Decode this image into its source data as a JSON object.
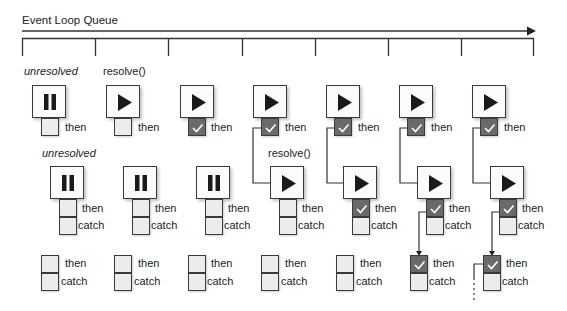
{
  "title": "Event Loop Queue",
  "timeline": {
    "ticks_x": [
      22,
      95,
      168,
      242,
      315,
      388,
      462,
      534
    ],
    "line_color": "#333333"
  },
  "labels": {
    "unresolved_1": "unresolved",
    "resolve_1": "resolve()",
    "unresolved_2": "unresolved",
    "resolve_2": "resolve()"
  },
  "slot_labels": {
    "then": "then",
    "catch": "catch"
  },
  "colors": {
    "checked_fill": "#6a6a6a",
    "unchecked_fill": "#ececec",
    "border": "#3a3a3a"
  },
  "legend": {
    "pause_icon": "unresolved promise",
    "play_icon": "resolved promise",
    "check_icon": "handler triggered"
  },
  "rows": [
    {
      "name": "promise-1",
      "columns": [
        {
          "state": "pause",
          "then": "unchecked"
        },
        {
          "state": "play",
          "then": "unchecked"
        },
        {
          "state": "play",
          "then": "checked"
        },
        {
          "state": "play",
          "then": "checked"
        },
        {
          "state": "play",
          "then": "checked"
        },
        {
          "state": "play",
          "then": "checked"
        },
        {
          "state": "play",
          "then": "checked"
        }
      ]
    },
    {
      "name": "promise-2",
      "columns": [
        {
          "state": "pause",
          "then": "unchecked",
          "catch": "unchecked"
        },
        {
          "state": "pause",
          "then": "unchecked",
          "catch": "unchecked"
        },
        {
          "state": "pause",
          "then": "unchecked",
          "catch": "unchecked"
        },
        {
          "state": "play",
          "then": "unchecked",
          "catch": "unchecked"
        },
        {
          "state": "play",
          "then": "checked",
          "catch": "unchecked"
        },
        {
          "state": "play",
          "then": "checked",
          "catch": "unchecked"
        },
        {
          "state": "play",
          "then": "checked",
          "catch": "unchecked"
        }
      ]
    },
    {
      "name": "promise-3",
      "columns": [
        {
          "then": "unchecked",
          "catch": "unchecked"
        },
        {
          "then": "unchecked",
          "catch": "unchecked"
        },
        {
          "then": "unchecked",
          "catch": "unchecked"
        },
        {
          "then": "unchecked",
          "catch": "unchecked"
        },
        {
          "then": "unchecked",
          "catch": "unchecked"
        },
        {
          "then": "checked",
          "catch": "unchecked"
        },
        {
          "then": "checked",
          "catch": "unchecked"
        }
      ]
    }
  ]
}
